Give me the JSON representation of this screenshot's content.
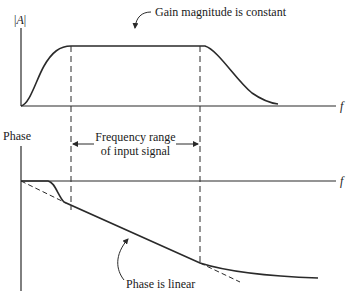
{
  "figure": {
    "gain_plot": {
      "y_axis_label_prefix": "|",
      "y_axis_label_var": "A",
      "y_axis_label_suffix": "|",
      "x_axis_label": "f",
      "annotation": "Gain magnitude is constant"
    },
    "phase_plot": {
      "y_axis_label": "Phase",
      "x_axis_label": "f",
      "annotation": "Phase is linear"
    },
    "range_annotation": {
      "line1": "Frequency range",
      "line2": "of input signal"
    },
    "colors": {
      "ink": "#2a2a2a",
      "background": "#ffffff"
    }
  }
}
